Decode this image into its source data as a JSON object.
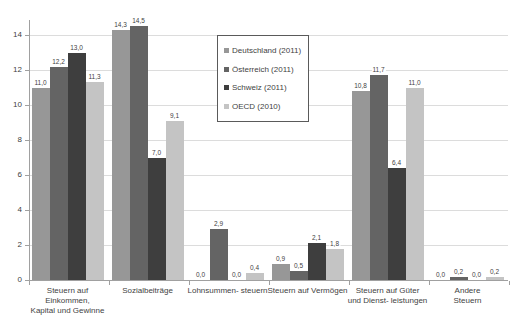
{
  "chart_data": {
    "type": "bar",
    "title": "",
    "xlabel": "",
    "ylabel": "",
    "ylim": [
      0,
      15
    ],
    "yticks": [
      0,
      2,
      4,
      6,
      8,
      10,
      12,
      14
    ],
    "grid": true,
    "decimal_separator": ",",
    "legend_position": "inside-upper-left",
    "categories": [
      {
        "label": "Steuern auf Einkommen, Kapital und Gewinne",
        "lines": [
          "Steuern auf",
          "Einkommen,",
          "Kapital und Gewinne"
        ]
      },
      {
        "label": "Sozialbeiträge",
        "lines": [
          "Sozialbeiträge"
        ]
      },
      {
        "label": "Lohnsummen- steuern",
        "lines": [
          "Lohnsummen- steuern"
        ]
      },
      {
        "label": "Steuern auf Vermögen",
        "lines": [
          "Steuern auf Vermögen"
        ]
      },
      {
        "label": "Steuern auf Güter und Dienst- leistungen",
        "lines": [
          "Steuern auf Güter",
          "und Dienst- leistungen"
        ]
      },
      {
        "label": "Andere Steuern",
        "lines": [
          "Andere",
          "Steuern"
        ]
      }
    ],
    "series": [
      {
        "name": "Deutschland (2011)",
        "color": "#979797",
        "values": [
          11.0,
          14.3,
          0.0,
          0.9,
          10.8,
          0.0
        ],
        "value_labels": [
          "11,0",
          "14,3",
          "0,0",
          "0,9",
          "10,8",
          "0,0"
        ]
      },
      {
        "name": "Österreich (2011)",
        "color": "#646464",
        "values": [
          12.2,
          14.5,
          2.9,
          0.5,
          11.7,
          0.2
        ],
        "value_labels": [
          "12,2",
          "14,5",
          "2,9",
          "0,5",
          "11,7",
          "0,2"
        ]
      },
      {
        "name": "Schweiz (2011)",
        "color": "#3e3e3e",
        "values": [
          13.0,
          7.0,
          0.0,
          2.1,
          6.4,
          0.0
        ],
        "value_labels": [
          "13,0",
          "7,0",
          "0,0",
          "2,1",
          "6,4",
          "0,0"
        ]
      },
      {
        "name": "OECD (2010)",
        "color": "#c4c4c4",
        "values": [
          11.3,
          9.1,
          0.4,
          1.8,
          11.0,
          0.2
        ],
        "value_labels": [
          "11,3",
          "9,1",
          "0,4",
          "1,8",
          "11,0",
          "0,2"
        ]
      }
    ],
    "colors": {
      "background": "#ffffff",
      "gridline": "#dcdcdc",
      "axis": "#a0a0a0",
      "text": "#3f3f3f",
      "legend_border": "#5a5a5a"
    }
  }
}
